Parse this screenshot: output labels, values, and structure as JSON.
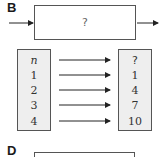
{
  "panels": [
    {
      "label": "B",
      "machine_text": "?"
    },
    {
      "label": "D"
    }
  ],
  "table": {
    "input_header": "n",
    "output_header": "?",
    "rows": [
      {
        "input": "1",
        "output": "1"
      },
      {
        "input": "2",
        "output": "4"
      },
      {
        "input": "3",
        "output": "7"
      },
      {
        "input": "4",
        "output": "10"
      }
    ]
  }
}
